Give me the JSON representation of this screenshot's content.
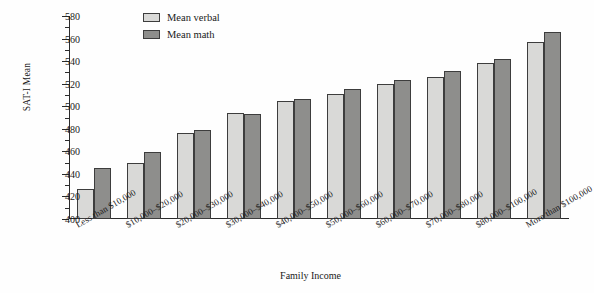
{
  "chart_data": {
    "type": "bar",
    "title": "",
    "xlabel": "Family Income",
    "ylabel": "SAT-I Mean",
    "ylim": [
      400,
      580
    ],
    "ytick_step": 20,
    "yminor_step": 10,
    "grid": false,
    "legend_position": "top-center",
    "categories": [
      "Less than $10,000",
      "$10,000–$20,000",
      "$20,000–$30,000",
      "$30,000–$40,000",
      "$40,000–$50,000",
      "$50,000–$60,000",
      "$60,000–$70,000",
      "$70,000–$80,000",
      "$80,000–$100,000",
      "More than $100,000"
    ],
    "series": [
      {
        "name": "Mean verbal",
        "color": "#d9d9d7",
        "values": [
          427,
          450,
          476,
          494,
          505,
          511,
          520,
          526,
          538,
          557
        ]
      },
      {
        "name": "Mean math",
        "color": "#8e8e8c",
        "values": [
          445,
          459,
          479,
          493,
          506,
          515,
          523,
          531,
          542,
          566
        ]
      }
    ],
    "ytick_labels": [
      "400",
      "420",
      "440",
      "460",
      "480",
      "500",
      "520",
      "540",
      "560",
      "580"
    ]
  },
  "legend": {
    "items": [
      {
        "label": "Mean verbal",
        "swatch": "verbal"
      },
      {
        "label": "Mean math",
        "swatch": "math"
      }
    ]
  },
  "axis": {
    "y_title": "SAT-I Mean",
    "x_title": "Family Income"
  }
}
